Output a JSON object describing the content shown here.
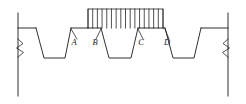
{
  "diagram": {
    "type": "engineering-elevation",
    "canvas": {
      "width": 246,
      "height": 104
    },
    "background_color": "#ffffff",
    "line_color": "#1a1a1a"
  },
  "labels": [
    {
      "id": "A",
      "text": "A",
      "x": 74,
      "y": 45
    },
    {
      "id": "B",
      "text": "B",
      "x": 95,
      "y": 45
    },
    {
      "id": "C",
      "text": "C",
      "x": 141,
      "y": 45
    },
    {
      "id": "D",
      "text": "D",
      "x": 167,
      "y": 45
    }
  ],
  "baseline": {
    "name": "top-surface",
    "y": 28,
    "x_start": 18,
    "x_end": 228
  },
  "boundaries": {
    "left": {
      "x": 18,
      "y_top": 13,
      "y_bottom": 96
    },
    "right": {
      "x": 228,
      "y_top": 13,
      "y_bottom": 96
    },
    "break_symbol_y": 48
  },
  "notches": [
    {
      "name": "notch-1",
      "top_left_x": 36,
      "top_right_x": 71,
      "bottom_left_x": 44,
      "bottom_right_x": 65,
      "top_y": 28,
      "bottom_y": 58
    },
    {
      "name": "notch-2",
      "top_left_x": 101,
      "top_right_x": 138,
      "bottom_left_x": 109,
      "bottom_right_x": 131,
      "top_y": 28,
      "bottom_y": 58
    },
    {
      "name": "notch-3",
      "top_left_x": 165,
      "top_right_x": 201,
      "bottom_left_x": 173,
      "bottom_right_x": 194,
      "top_y": 28,
      "bottom_y": 58
    }
  ],
  "distributed_load": {
    "name": "uniform-distributed-load",
    "x_start": 88,
    "x_end": 163,
    "y_top": 9,
    "y_base": 28,
    "hatch_count": 16
  },
  "leaders": [
    {
      "id": "A",
      "from_x": 71,
      "from_y": 29,
      "to_x": 77,
      "to_y": 39
    },
    {
      "id": "B",
      "from_x": 101,
      "from_y": 29,
      "to_x": 96,
      "to_y": 39
    },
    {
      "id": "C",
      "from_x": 138,
      "from_y": 29,
      "to_x": 143,
      "to_y": 39
    },
    {
      "id": "D",
      "from_x": 165,
      "from_y": 29,
      "to_x": 169,
      "to_y": 39
    }
  ]
}
